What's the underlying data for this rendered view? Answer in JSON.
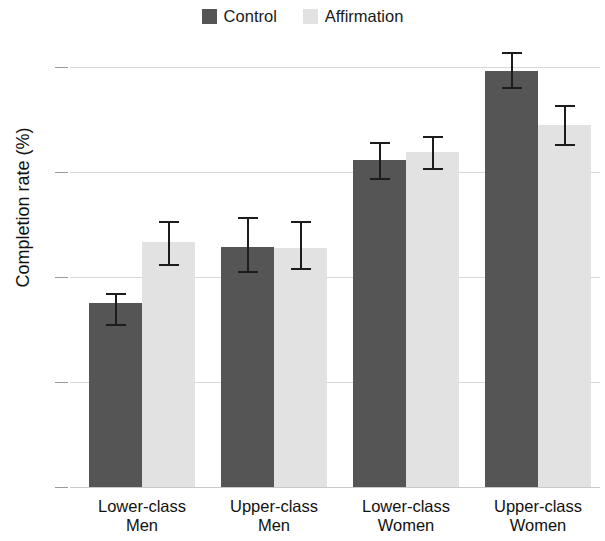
{
  "chart_data": {
    "type": "bar",
    "title": "",
    "subtitle": "",
    "xlabel": "",
    "ylabel": "Completion rate (%)",
    "ylim": [
      0,
      63
    ],
    "yticks": [
      0,
      15,
      30,
      45,
      60
    ],
    "ytick_labels": [
      "0",
      "15",
      "30",
      "45",
      "60"
    ],
    "grid": "horizontal",
    "legend_position": "top-center",
    "categories": [
      "Lower-class Men",
      "Upper-class Men",
      "Lower-class Women",
      "Upper-class Women"
    ],
    "category_lines": [
      [
        "Lower-class",
        "Men"
      ],
      [
        "Upper-class",
        "Men"
      ],
      [
        "Lower-class",
        "Women"
      ],
      [
        "Upper-class",
        "Women"
      ]
    ],
    "series": [
      {
        "name": "Control",
        "color": "#555555",
        "values": [
          26.3,
          34.3,
          46.7,
          59.4
        ],
        "errors_low": [
          23.0,
          30.6,
          43.9,
          56.9
        ],
        "errors_high": [
          27.7,
          38.6,
          49.3,
          62.1
        ]
      },
      {
        "name": "Affirmation",
        "color": "#e2e2e2",
        "values": [
          35.0,
          34.1,
          47.9,
          51.7
        ],
        "errors_low": [
          31.6,
          31.0,
          45.3,
          48.7
        ],
        "errors_high": [
          38.0,
          38.0,
          50.1,
          54.6
        ]
      }
    ]
  },
  "legend": {
    "entries": [
      {
        "label": "Control",
        "color": "#555555"
      },
      {
        "label": "Affirmation",
        "color": "#e2e2e2"
      }
    ]
  }
}
